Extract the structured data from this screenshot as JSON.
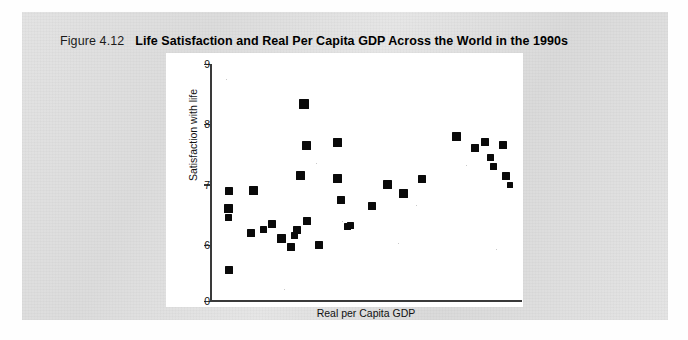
{
  "figure": {
    "number": "Figure 4.12",
    "title": "Life Satisfaction and Real Per Capita GDP Across the World in the 1990s"
  },
  "chart_data": {
    "type": "scatter",
    "title": "Life Satisfaction and Real Per Capita GDP Across the World in the 1990s",
    "xlabel": "Real per Capita GDP",
    "ylabel": "Satisfaction with life",
    "grid": false,
    "legend": null,
    "xlim": [
      0,
      100
    ],
    "ylim": [
      0,
      9
    ],
    "x_tick_labels": [],
    "y_tick_labels": [
      "9",
      "8",
      "7",
      "6",
      "0"
    ],
    "y_tick_values": [
      9,
      8,
      7,
      6,
      0
    ],
    "y_axis_note": "broken axis: linear from 6 to 9, then drops directly to 0",
    "marker": "filled-square",
    "marker_color": "#0a0a0a",
    "points": [
      {
        "x": 6,
        "y": 6.9
      },
      {
        "x": 6,
        "y": 6.6
      },
      {
        "x": 6,
        "y": 6.45
      },
      {
        "x": 6,
        "y": 3.3
      },
      {
        "x": 13,
        "y": 6.2
      },
      {
        "x": 14,
        "y": 6.9
      },
      {
        "x": 17,
        "y": 6.25
      },
      {
        "x": 20,
        "y": 6.35
      },
      {
        "x": 23,
        "y": 6.1
      },
      {
        "x": 26,
        "y": 5.75
      },
      {
        "x": 27,
        "y": 6.15
      },
      {
        "x": 28,
        "y": 6.25
      },
      {
        "x": 29,
        "y": 7.15
      },
      {
        "x": 30,
        "y": 8.33
      },
      {
        "x": 31,
        "y": 6.4
      },
      {
        "x": 31,
        "y": 7.65
      },
      {
        "x": 35,
        "y": 6.0
      },
      {
        "x": 41,
        "y": 7.1
      },
      {
        "x": 41,
        "y": 7.7
      },
      {
        "x": 42,
        "y": 6.75
      },
      {
        "x": 44,
        "y": 6.3
      },
      {
        "x": 45,
        "y": 6.32
      },
      {
        "x": 52,
        "y": 6.65
      },
      {
        "x": 57,
        "y": 7.0
      },
      {
        "x": 62,
        "y": 6.85
      },
      {
        "x": 68,
        "y": 7.1
      },
      {
        "x": 79,
        "y": 7.8
      },
      {
        "x": 85,
        "y": 7.6
      },
      {
        "x": 88,
        "y": 7.7
      },
      {
        "x": 90,
        "y": 7.45
      },
      {
        "x": 91,
        "y": 7.3
      },
      {
        "x": 94,
        "y": 7.65
      },
      {
        "x": 95,
        "y": 7.15
      },
      {
        "x": 96,
        "y": 7.0
      }
    ]
  }
}
